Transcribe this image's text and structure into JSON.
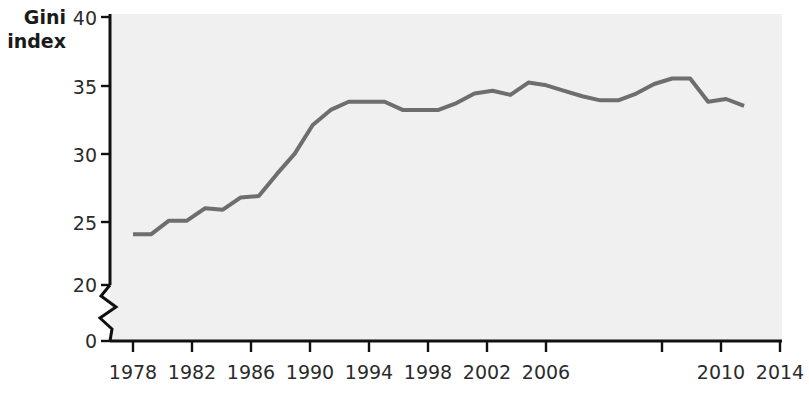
{
  "chart_data": {
    "type": "line",
    "title": "",
    "subtitle": "",
    "xlabel": "",
    "ylabel": "Gini index",
    "ylabel_lines": [
      "Gini",
      "index"
    ],
    "x": [
      1978,
      1979,
      1980,
      1981,
      1982,
      1983,
      1984,
      1985,
      1986,
      1987,
      1988,
      1989,
      1990,
      1991,
      1992,
      1993,
      1994,
      1995,
      1996,
      1997,
      1998,
      1999,
      2000,
      2001,
      2002,
      2003,
      2004,
      2005,
      2006,
      2007,
      2008,
      2009,
      2010,
      2011,
      2012
    ],
    "values": [
      24.1,
      24.1,
      25.1,
      25.1,
      26.0,
      25.9,
      26.8,
      26.9,
      28.5,
      30.0,
      32.1,
      33.2,
      33.8,
      33.8,
      33.8,
      33.2,
      33.2,
      33.2,
      33.7,
      34.4,
      34.6,
      34.3,
      35.2,
      35.0,
      34.6,
      34.2,
      33.9,
      33.9,
      34.4,
      35.1,
      35.5,
      35.5,
      33.8,
      34.0,
      33.5
    ],
    "series": [
      {
        "name": "Gini index",
        "color": "#6e6e6e",
        "values": [
          24.1,
          24.1,
          25.1,
          25.1,
          26.0,
          25.9,
          26.8,
          26.9,
          28.5,
          30.0,
          32.1,
          33.2,
          33.8,
          33.8,
          33.8,
          33.2,
          33.2,
          33.2,
          33.7,
          34.4,
          34.6,
          34.3,
          35.2,
          35.0,
          34.6,
          34.2,
          33.9,
          33.9,
          34.4,
          35.1,
          35.5,
          35.5,
          33.8,
          34.0,
          33.5
        ]
      }
    ],
    "ylim": [
      0,
      40
    ],
    "y_ticks": [
      0,
      20,
      25,
      30,
      35,
      40
    ],
    "y_tick_labels": [
      "0",
      "20",
      "25",
      "30",
      "35",
      "40"
    ],
    "y_axis_break": {
      "present": true,
      "between": [
        0,
        20
      ],
      "style": "zigzag"
    },
    "xlim": [
      1977,
      2014
    ],
    "x_ticks": [
      1978,
      1982,
      1986,
      1990,
      1994,
      1998,
      2002,
      2006,
      2010,
      2014
    ],
    "x_tick_labels": [
      "1978",
      "1982",
      "1986",
      "1990",
      "1994",
      "1998",
      "2002",
      "2006",
      "2010",
      "2014"
    ],
    "grid": false,
    "legend": {
      "show": false,
      "position": "none"
    },
    "annotations": [],
    "colors": {
      "line": "#6e6e6e",
      "plot_background": "#f0f0f0",
      "axis": "#111111",
      "text": "#1a1a1a",
      "page_background": "#ffffff"
    }
  }
}
